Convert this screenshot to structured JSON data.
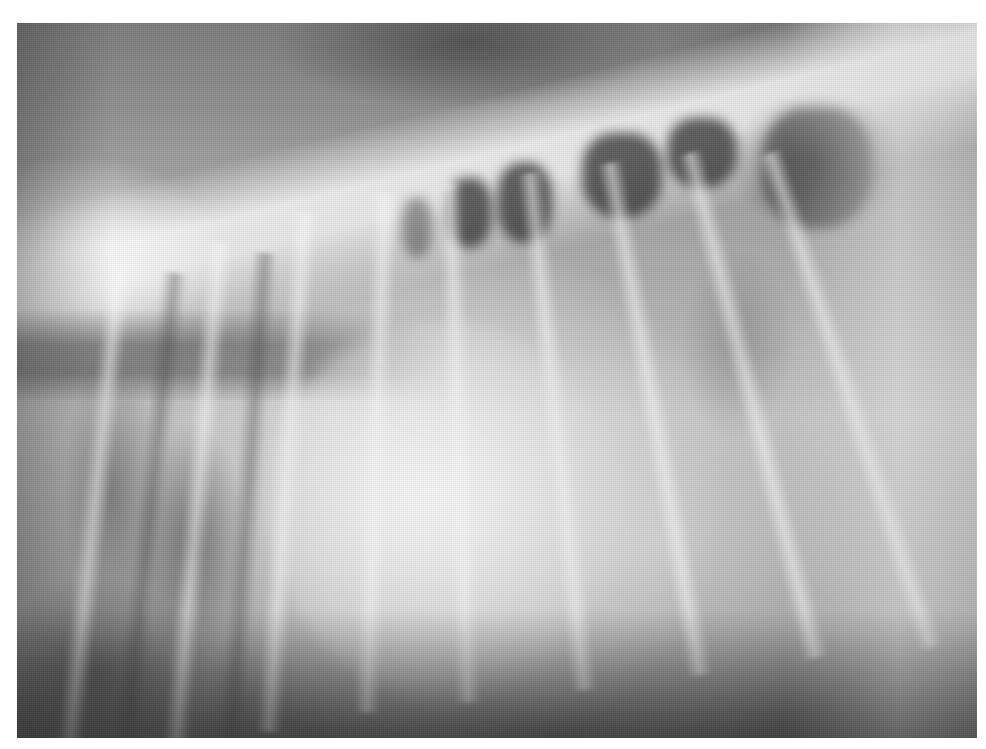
{
  "image": {
    "kind": "radiograph",
    "view": "lateral thoracic",
    "description": "Grayscale lateral thoracic X-ray showing vertebral column along top, rib shadows, dark dorsal lung fields, and enlarged bright cardiac silhouette in center",
    "frame": {
      "left": 17,
      "top": 23,
      "width": 960,
      "height": 715
    },
    "background_color": "#ffffff",
    "tones": {
      "brightest": "#f5f5f5",
      "mid": "#a8a8a8",
      "darkest": "#2d2d2d"
    }
  }
}
